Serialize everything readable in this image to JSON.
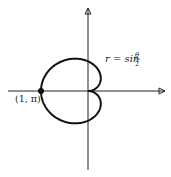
{
  "chart_data": {
    "type": "line",
    "title": "",
    "equation": "r = sin(θ/2)",
    "equation_label": {
      "lhs": "r = sin",
      "num": "θ",
      "den": "2"
    },
    "point_label": "(1, π)",
    "theta_range": [
      0,
      6.283185307
    ],
    "marked_point": {
      "r": 1,
      "theta": 3.14159265
    },
    "xlabel": "",
    "ylabel": "",
    "grid": false,
    "legend": "none",
    "layout": {
      "origin_px": [
        88,
        91
      ],
      "scale_px": [
        47,
        42
      ],
      "x_axis_px": [
        8,
        165
      ],
      "y_axis_px": [
        8,
        170
      ]
    },
    "colors": {
      "curve": "#111111",
      "axis": "#222222"
    }
  }
}
